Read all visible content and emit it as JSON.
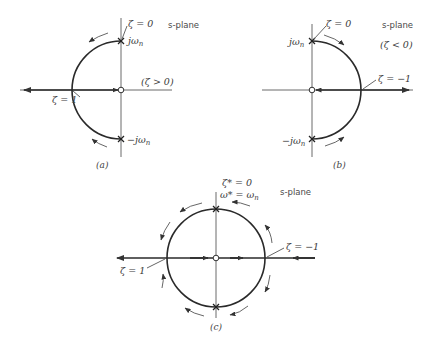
{
  "diagram": {
    "type": "root-locus-s-plane",
    "panels": [
      {
        "id": "a",
        "caption": "(a)",
        "plane_label": "s-plane",
        "condition": "(ζ > 0)",
        "zeta0_label": "ζ = 0",
        "jwn_label": "jω",
        "jwn_sub": "n",
        "neg_jwn_label": "−jω",
        "neg_jwn_sub": "n",
        "zeta1_label": "ζ = 1",
        "half": "left"
      },
      {
        "id": "b",
        "caption": "(b)",
        "plane_label": "s-plane",
        "condition": "(ζ < 0)",
        "zeta0_label": "ζ = 0",
        "jwn_label": "jω",
        "jwn_sub": "n",
        "neg_jwn_label": "−jω",
        "neg_jwn_sub": "n",
        "zetam1_label": "ζ = −1",
        "half": "right"
      },
      {
        "id": "c",
        "caption": "(c)",
        "plane_label": "s-plane",
        "top_label_1": "ζ* = 0",
        "top_label_2_a": "ω* = ω",
        "top_label_2_sub": "n",
        "zeta1_label": "ζ = 1",
        "zetam1_label": "ζ = −1",
        "half": "full"
      }
    ]
  }
}
